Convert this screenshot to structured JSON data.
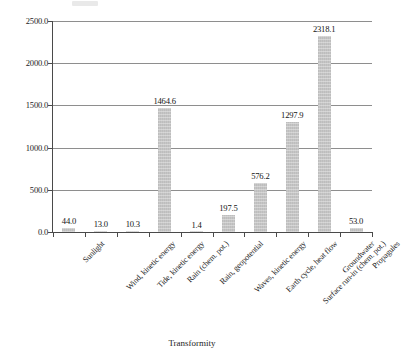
{
  "chart_data": {
    "type": "bar",
    "title": "",
    "xlabel": "Transformity",
    "ylabel": "",
    "grid": true,
    "legend": false,
    "ylim": [
      0,
      2500
    ],
    "ytick_labels": [
      "2500.0",
      "2000.0",
      "1500.0",
      "1000.0",
      "500.0",
      "0.0"
    ],
    "ytick_values": [
      2500,
      2000,
      1500,
      1000,
      500,
      0
    ],
    "categories": [
      "Sunlight",
      "Wind, kinetic energy",
      "Tide, kinetic energy",
      "Rain (chem. pot.)",
      "Rain, geopotential",
      "Waves, kinetic energy",
      "Earth cycle, heat flow",
      "Surface run-in (chem. pot.)",
      "Groundwater",
      "Propagules"
    ],
    "values": [
      44.0,
      13.0,
      10.3,
      1464.6,
      1.4,
      197.5,
      576.2,
      1297.9,
      2318.1,
      53.0
    ],
    "value_labels": [
      "44.0",
      "13.0",
      "10.3",
      "1464.6",
      "1.4",
      "197.5",
      "576.2",
      "1297.9",
      "2318.1",
      "53.0"
    ],
    "bar_color": "#c6c6c6",
    "axis_color": "#4a4a4a",
    "grid_color": "#8e8e8e",
    "text_color": "#1c1c1c"
  }
}
